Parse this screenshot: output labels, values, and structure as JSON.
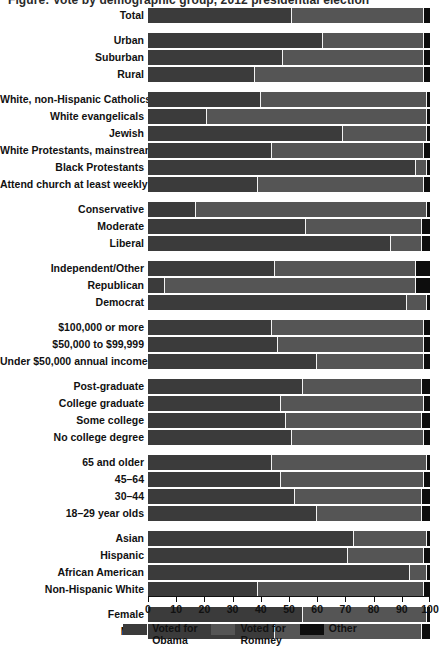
{
  "title": "Figure: Vote by demographic group, 2012 presidential election",
  "colors": {
    "obama": "#3b3b3b",
    "romney": "#555555",
    "other": "#0d0d0d",
    "background": "#ffffff",
    "text": "#111111"
  },
  "legend": [
    {
      "name": "obama",
      "label": "Voted for\nObama",
      "color": "#3b3b3b"
    },
    {
      "name": "romney",
      "label": "Voted for\nRomney",
      "color": "#555555"
    },
    {
      "name": "other",
      "label": "Other",
      "color": "#0d0d0d"
    }
  ],
  "axis": {
    "ticks": [
      0,
      10,
      20,
      30,
      40,
      50,
      60,
      70,
      80,
      90,
      100
    ],
    "min": 0,
    "max": 100
  },
  "chart_data": {
    "type": "bar",
    "orientation": "horizontal",
    "stacked": true,
    "title": "Figure: Vote by demographic group, 2012 presidential election",
    "xlabel": "",
    "ylabel": "",
    "xlim": [
      0,
      100
    ],
    "grid": false,
    "legend_position": "bottom-center",
    "series": [
      {
        "name": "Voted for Obama",
        "color": "#3b3b3b"
      },
      {
        "name": "Voted for Romney",
        "color": "#555555"
      },
      {
        "name": "Other",
        "color": "#0d0d0d"
      }
    ],
    "groups": [
      {
        "name": "total",
        "rows": [
          {
            "label": "Total",
            "obama": 51,
            "romney": 47,
            "other": 2
          }
        ]
      },
      {
        "name": "community-type",
        "rows": [
          {
            "label": "Urban",
            "obama": 62,
            "romney": 36,
            "other": 2
          },
          {
            "label": "Suburban",
            "obama": 48,
            "romney": 50,
            "other": 2
          },
          {
            "label": "Rural",
            "obama": 38,
            "romney": 60,
            "other": 2
          }
        ]
      },
      {
        "name": "religion",
        "rows": [
          {
            "label": "White, non-Hispanic Catholics",
            "obama": 40,
            "romney": 59,
            "other": 1
          },
          {
            "label": "White evangelicals",
            "obama": 21,
            "romney": 78,
            "other": 1
          },
          {
            "label": "Jewish",
            "obama": 69,
            "romney": 30,
            "other": 1
          },
          {
            "label": "White Protestants, mainstream",
            "obama": 44,
            "romney": 54,
            "other": 2
          },
          {
            "label": "Black Protestants",
            "obama": 95,
            "romney": 4,
            "other": 1
          },
          {
            "label": "Attend church at least weekly",
            "obama": 39,
            "romney": 59,
            "other": 2
          }
        ]
      },
      {
        "name": "ideology",
        "rows": [
          {
            "label": "Conservative",
            "obama": 17,
            "romney": 82,
            "other": 1
          },
          {
            "label": "Moderate",
            "obama": 56,
            "romney": 41,
            "other": 3
          },
          {
            "label": "Liberal",
            "obama": 86,
            "romney": 11,
            "other": 3
          }
        ]
      },
      {
        "name": "party-id",
        "rows": [
          {
            "label": "Independent/Other",
            "obama": 45,
            "romney": 50,
            "other": 5
          },
          {
            "label": "Republican",
            "obama": 6,
            "romney": 89,
            "other": 5
          },
          {
            "label": "Democrat",
            "obama": 92,
            "romney": 7,
            "other": 1
          }
        ]
      },
      {
        "name": "income",
        "rows": [
          {
            "label": "$100,000 or more",
            "obama": 44,
            "romney": 54,
            "other": 2
          },
          {
            "label": "$50,000 to $99,999",
            "obama": 46,
            "romney": 52,
            "other": 2
          },
          {
            "label": "Under $50,000 annual income",
            "obama": 60,
            "romney": 38,
            "other": 2
          }
        ]
      },
      {
        "name": "education",
        "rows": [
          {
            "label": "Post-graduate",
            "obama": 55,
            "romney": 42,
            "other": 3
          },
          {
            "label": "College graduate",
            "obama": 47,
            "romney": 51,
            "other": 2
          },
          {
            "label": "Some college",
            "obama": 49,
            "romney": 48,
            "other": 3
          },
          {
            "label": "No college degree",
            "obama": 51,
            "romney": 47,
            "other": 2
          }
        ]
      },
      {
        "name": "age",
        "rows": [
          {
            "label": "65 and older",
            "obama": 44,
            "romney": 55,
            "other": 1
          },
          {
            "label": "45–64",
            "obama": 47,
            "romney": 51,
            "other": 2
          },
          {
            "label": "30–44",
            "obama": 52,
            "romney": 45,
            "other": 3
          },
          {
            "label": "18–29 year olds",
            "obama": 60,
            "romney": 37,
            "other": 3
          }
        ]
      },
      {
        "name": "race",
        "rows": [
          {
            "label": "Asian",
            "obama": 73,
            "romney": 26,
            "other": 1
          },
          {
            "label": "Hispanic",
            "obama": 71,
            "romney": 27,
            "other": 2
          },
          {
            "label": "African American",
            "obama": 93,
            "romney": 6,
            "other": 1
          },
          {
            "label": "Non-Hispanic White",
            "obama": 39,
            "romney": 59,
            "other": 2
          }
        ]
      },
      {
        "name": "gender",
        "rows": [
          {
            "label": "Female",
            "obama": 55,
            "romney": 44,
            "other": 1
          },
          {
            "label": "Male",
            "obama": 45,
            "romney": 52,
            "other": 3
          }
        ]
      }
    ]
  }
}
